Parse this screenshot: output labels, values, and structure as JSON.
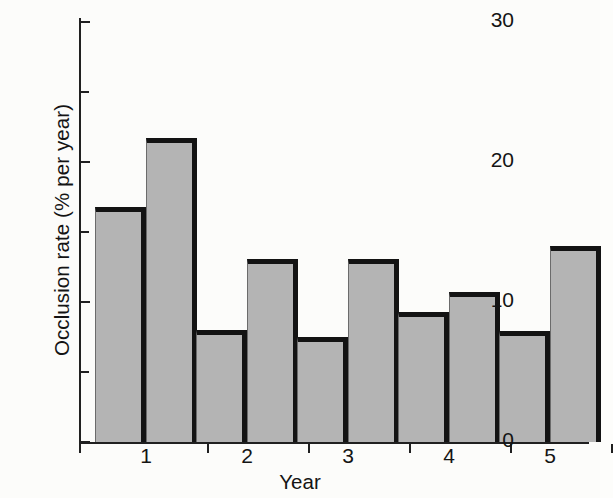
{
  "chart_data": {
    "type": "bar",
    "title": "",
    "xlabel": "Year",
    "ylabel": "Occlusion rate (% per year)",
    "categories": [
      "1",
      "2",
      "3",
      "4",
      "5"
    ],
    "ylim": [
      0,
      30
    ],
    "yticks": [
      0,
      10,
      20,
      30
    ],
    "ytick_labels": [
      "0",
      "10",
      "20",
      "30"
    ],
    "yminor_ticks": [
      5,
      15,
      25
    ],
    "grid": false,
    "legend": false,
    "series": [
      {
        "name": "bar-a",
        "values": [
          16.8,
          8.0,
          7.5,
          9.3,
          7.9
        ]
      },
      {
        "name": "bar-b",
        "values": [
          21.7,
          13.1,
          13.1,
          10.7,
          14.0
        ]
      }
    ],
    "bars": [
      {
        "group": "1",
        "index": 0,
        "value": 16.8
      },
      {
        "group": "1",
        "index": 1,
        "value": 21.7
      },
      {
        "group": "2",
        "index": 0,
        "value": 8.0
      },
      {
        "group": "2",
        "index": 1,
        "value": 13.1
      },
      {
        "group": "3",
        "index": 0,
        "value": 7.5
      },
      {
        "group": "3",
        "index": 1,
        "value": 13.1
      },
      {
        "group": "4",
        "index": 0,
        "value": 9.3
      },
      {
        "group": "4",
        "index": 1,
        "value": 10.7
      },
      {
        "group": "5",
        "index": 0,
        "value": 7.9
      },
      {
        "group": "5",
        "index": 1,
        "value": 14.0
      }
    ],
    "colors": {
      "bar_fill": "#b4b4b4",
      "bar_edge": "#131313",
      "axis": "#202020",
      "background": "#fcfcfa",
      "text": "#141414"
    }
  }
}
